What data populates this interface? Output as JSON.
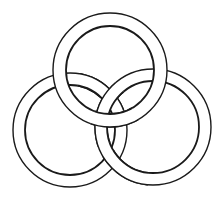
{
  "figure": {
    "type": "interlocking-rings",
    "ring_count": 3,
    "colors": {
      "background": "#ffffff",
      "line": "#1a1a1a",
      "band_fill": "#ffffff"
    },
    "rings": [
      {
        "name": "top",
        "cx": 110,
        "cy": 70,
        "outer_r": 57,
        "inner_r": 44
      },
      {
        "name": "left",
        "cx": 70,
        "cy": 130,
        "outer_r": 57,
        "inner_r": 45
      },
      {
        "name": "right",
        "cx": 153,
        "cy": 127,
        "outer_r": 58,
        "inner_r": 46
      }
    ]
  }
}
